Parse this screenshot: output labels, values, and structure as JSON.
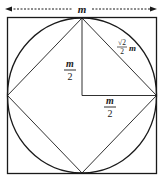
{
  "diagram": {
    "top_label": "m",
    "vertical_leg": {
      "numerator": "m",
      "denominator": "2"
    },
    "horizontal_leg": {
      "numerator": "m",
      "denominator": "2"
    },
    "hypotenuse": {
      "radical": "√2",
      "denominator": "2",
      "variable": "m"
    },
    "colors": {
      "stroke": "#1a1a1a",
      "background": "#ffffff"
    }
  }
}
